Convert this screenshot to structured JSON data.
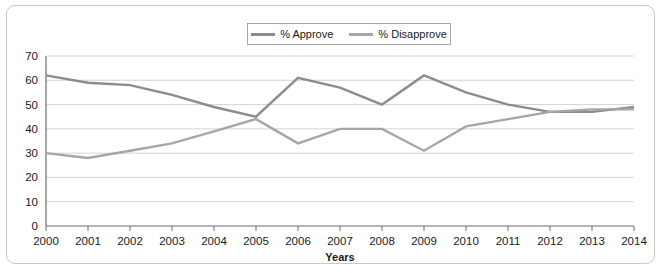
{
  "legend": {
    "position": "top-center",
    "entries": [
      {
        "label": "% Approve",
        "color": "#8c8c8c",
        "icon": "line-swatch-icon"
      },
      {
        "label": "% Disapprove",
        "color": "#a6a6a6",
        "icon": "line-swatch-icon"
      }
    ]
  },
  "axes": {
    "x_title": "Years",
    "y_title": "",
    "y_ticks": [
      "0",
      "10",
      "20",
      "30",
      "40",
      "50",
      "60",
      "70"
    ],
    "x_ticks": [
      "2000",
      "2001",
      "2002",
      "2003",
      "2004",
      "2005",
      "2006",
      "2007",
      "2008",
      "2009",
      "2010",
      "2011",
      "2012",
      "2013",
      "2014"
    ]
  },
  "chart_data": {
    "type": "line",
    "title": "",
    "subtitle": "",
    "xlabel": "Years",
    "ylabel": "",
    "xlim": [
      2000,
      2014
    ],
    "ylim": [
      0,
      70
    ],
    "grid": true,
    "legend_position": "top-center",
    "categories": [
      2000,
      2001,
      2002,
      2003,
      2004,
      2005,
      2006,
      2007,
      2008,
      2009,
      2010,
      2011,
      2012,
      2013,
      2014
    ],
    "series": [
      {
        "name": "% Approve",
        "color": "#8c8c8c",
        "values": [
          62,
          59,
          58,
          54,
          49,
          45,
          61,
          57,
          50,
          62,
          55,
          50,
          47,
          47,
          49
        ]
      },
      {
        "name": "% Disapprove",
        "color": "#a6a6a6",
        "values": [
          30,
          28,
          31,
          34,
          39,
          44,
          34,
          40,
          40,
          31,
          41,
          44,
          47,
          48,
          48
        ]
      }
    ]
  }
}
